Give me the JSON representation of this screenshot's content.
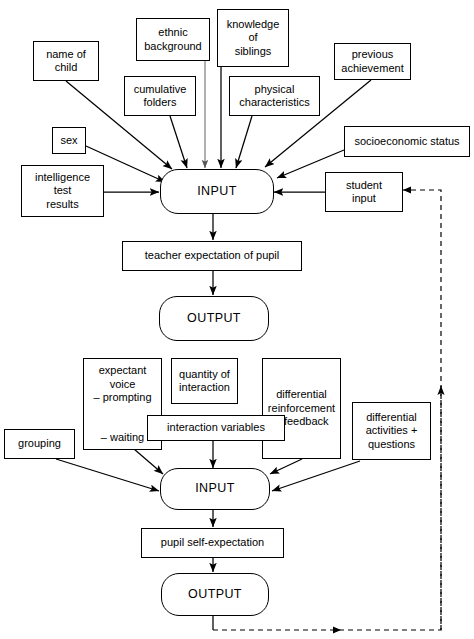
{
  "diagram": {
    "type": "flowchart",
    "stroke_color": "#000000",
    "faint_stroke_color": "#7a7a7a",
    "background_color": "#ffffff"
  },
  "nodes": {
    "name_of_child": "name of\nchild",
    "ethnic_background": "ethnic\nbackground",
    "knowledge_of_siblings": "knowledge\nof\nsiblings",
    "previous_achievement": "previous\nachievement",
    "cumulative_folders": "cumulative\nfolders",
    "physical_characteristics": "physical\ncharacteristics",
    "sex": "sex",
    "socioeconomic_status": "socioeconomic status",
    "intelligence_test_results": "intelligence\ntest\nresults",
    "input_top": "INPUT",
    "student_input": "student\ninput",
    "teacher_expectation": "teacher expectation of pupil",
    "output_top": "OUTPUT",
    "expectant_voice_top": "expectant\nvoice\n– prompting",
    "expectant_voice_bottom": "– waiting",
    "quantity_of_interaction": "quantity of\ninteraction",
    "differential_reinforcement": "differential\nreinforcement\n+ feedback",
    "interaction_variables": "interaction variables",
    "differential_activities": "differential\nactivities +\nquestions",
    "grouping": "grouping",
    "input_bottom": "INPUT",
    "pupil_self_expectation": "pupil self-expectation",
    "output_bottom": "OUTPUT"
  },
  "edges": [
    {
      "from": "name_of_child",
      "to": "input_top",
      "style": "solid",
      "arrow": true
    },
    {
      "from": "ethnic_background",
      "to": "input_top",
      "style": "solid-faint",
      "arrow": true
    },
    {
      "from": "knowledge_of_siblings",
      "to": "input_top",
      "style": "solid",
      "arrow": true
    },
    {
      "from": "cumulative_folders",
      "to": "input_top",
      "style": "solid",
      "arrow": true
    },
    {
      "from": "physical_characteristics",
      "to": "input_top",
      "style": "solid",
      "arrow": true
    },
    {
      "from": "previous_achievement",
      "to": "input_top",
      "style": "solid",
      "arrow": true
    },
    {
      "from": "sex",
      "to": "input_top",
      "style": "solid",
      "arrow": true
    },
    {
      "from": "socioeconomic_status",
      "to": "input_top",
      "style": "solid",
      "arrow": true
    },
    {
      "from": "intelligence_test_results",
      "to": "input_top",
      "style": "solid",
      "arrow": true
    },
    {
      "from": "student_input",
      "to": "input_top",
      "style": "solid",
      "arrow": true
    },
    {
      "from": "input_top",
      "to": "teacher_expectation",
      "style": "solid",
      "arrow": true
    },
    {
      "from": "teacher_expectation",
      "to": "output_top",
      "style": "solid",
      "arrow": true
    },
    {
      "from": "expectant_voice",
      "to": "input_bottom",
      "style": "solid",
      "arrow": true
    },
    {
      "from": "interaction_variables",
      "to": "input_bottom",
      "style": "solid",
      "arrow": true
    },
    {
      "from": "differential_reinforcement",
      "to": "input_bottom",
      "style": "solid",
      "arrow": true
    },
    {
      "from": "differential_activities",
      "to": "input_bottom",
      "style": "solid",
      "arrow": true
    },
    {
      "from": "grouping",
      "to": "input_bottom",
      "style": "solid",
      "arrow": true
    },
    {
      "from": "input_bottom",
      "to": "pupil_self_expectation",
      "style": "solid",
      "arrow": true
    },
    {
      "from": "pupil_self_expectation",
      "to": "output_bottom",
      "style": "solid",
      "arrow": true
    },
    {
      "from": "output_bottom",
      "to": "student_input",
      "style": "dashed",
      "arrow": true,
      "note": "feedback loop around right side"
    },
    {
      "from": "feedback_line",
      "to": "interaction_area",
      "style": "dashed",
      "arrow": true,
      "note": "upward arrow on right dashed line"
    }
  ]
}
